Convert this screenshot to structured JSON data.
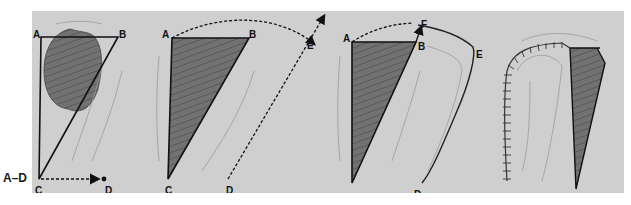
{
  "figure": {
    "label": "A–D",
    "background_color": "#cfcfcf",
    "flap_fill_color": "#6e6e6e",
    "defect_fill_color": "#6a6a6a"
  },
  "panels": [
    {
      "id": "A",
      "description": "Triangular defect ABC with lesion; arrow from C to D",
      "points": {
        "A": "A",
        "B": "B",
        "C": "C",
        "D": "D"
      }
    },
    {
      "id": "B",
      "description": "Excised triangle ABC; dotted arc from A through E; dotted line D to E",
      "points": {
        "A": "A",
        "B": "B",
        "C": "C",
        "D": "D",
        "E": "E"
      }
    },
    {
      "id": "C",
      "description": "Rotation flap incised along D-E-F; arrow F toward B",
      "points": {
        "A": "A",
        "B": "B",
        "D": "D",
        "E": "E",
        "F": "F"
      }
    },
    {
      "id": "D",
      "description": "Flap rotated and sutured; remaining triangular donor area",
      "points": {}
    }
  ]
}
